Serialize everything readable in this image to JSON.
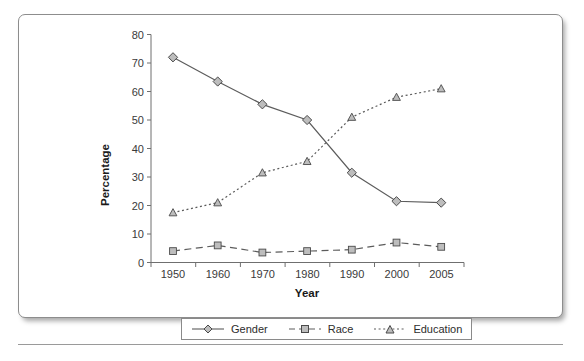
{
  "chart_data": {
    "type": "line",
    "title": "",
    "xlabel": "Year",
    "ylabel": "Percentage",
    "categories": [
      "1950",
      "1960",
      "1970",
      "1980",
      "1990",
      "2000",
      "2005"
    ],
    "ylim": [
      0,
      80
    ],
    "yticks": [
      "0",
      "10",
      "20",
      "30",
      "40",
      "50",
      "60",
      "70",
      "80"
    ],
    "grid": false,
    "legend_position": "bottom",
    "series": [
      {
        "name": "Gender",
        "marker": "diamond",
        "line_style": "solid",
        "color": "#5c5c5c",
        "values": [
          72,
          63.5,
          55.5,
          50,
          31.5,
          21.5,
          21
        ]
      },
      {
        "name": "Race",
        "marker": "square",
        "line_style": "dashed",
        "color": "#5c5c5c",
        "values": [
          4,
          6,
          3.5,
          4,
          4.5,
          7,
          5.5
        ]
      },
      {
        "name": "Education",
        "marker": "triangle",
        "line_style": "dotted",
        "color": "#5c5c5c",
        "values": [
          17.5,
          21,
          31.5,
          35.5,
          51,
          58,
          61
        ]
      }
    ]
  },
  "axes": {
    "y_title": "Percentage",
    "x_title": "Year"
  },
  "legend": {
    "entries": [
      {
        "label": "Gender",
        "icon": "diamond-marker-solid-line-icon"
      },
      {
        "label": "Race",
        "icon": "square-marker-dashed-line-icon"
      },
      {
        "label": "Education",
        "icon": "triangle-marker-dotted-line-icon"
      }
    ]
  },
  "colors": {
    "line": "#5c5c5c",
    "marker_fill": "#bdbdbd",
    "marker_stroke": "#4a4a4a",
    "axis": "#6f6f6f",
    "card_border": "#8d8d8d"
  }
}
